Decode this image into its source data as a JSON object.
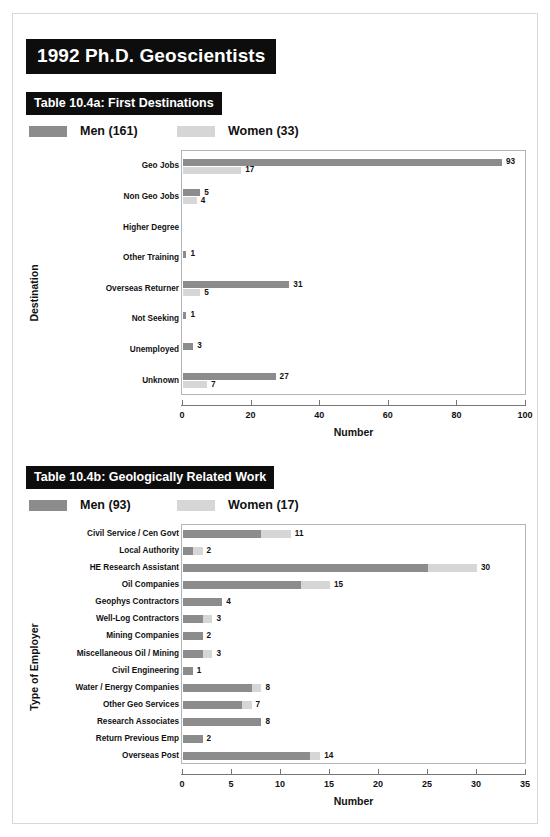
{
  "header": {
    "main_title": "1992 Ph.D. Geoscientists"
  },
  "colors": {
    "men": "#8c8c8c",
    "women": "#d6d6d6",
    "title_bg": "#0d0d0d",
    "title_fg": "#ffffff",
    "frame": "#b5b5b5"
  },
  "section_a": {
    "title": "Table 10.4a: First Destinations",
    "legend": [
      {
        "label": "Men (161)",
        "key": "men"
      },
      {
        "label": "Women (33)",
        "key": "women"
      }
    ]
  },
  "section_b": {
    "title": "Table 10.4b: Geologically Related Work",
    "legend": [
      {
        "label": "Men (93)",
        "key": "men"
      },
      {
        "label": "Women (17)",
        "key": "women"
      }
    ]
  },
  "chart_data": [
    {
      "id": "first-destinations",
      "type": "bar",
      "orientation": "horizontal",
      "grouping": "grouped",
      "title": "Table 10.4a: First Destinations",
      "xlabel": "Number",
      "ylabel": "Destination",
      "xlim": [
        0,
        100
      ],
      "xticks": [
        0,
        20,
        40,
        60,
        80,
        100
      ],
      "grid": false,
      "legend_position": "top-left",
      "categories": [
        "Geo Jobs",
        "Non Geo Jobs",
        "Higher Degree",
        "Other Training",
        "Overseas Returner",
        "Not Seeking",
        "Unemployed",
        "Unknown"
      ],
      "series": [
        {
          "name": "Men (161)",
          "key": "men",
          "values": [
            93,
            5,
            0,
            1,
            31,
            1,
            3,
            27
          ]
        },
        {
          "name": "Women (33)",
          "key": "women",
          "values": [
            17,
            4,
            0,
            0,
            5,
            0,
            0,
            7
          ]
        }
      ],
      "labels": {
        "men": [
          "93",
          "5",
          "",
          "1",
          "31",
          "1",
          "3",
          "27"
        ],
        "women": [
          "17",
          "4",
          "",
          "",
          "5",
          "",
          "",
          "7"
        ]
      }
    },
    {
      "id": "geologically-related-work",
      "type": "bar",
      "orientation": "horizontal",
      "grouping": "stacked",
      "title": "Table 10.4b: Geologically Related Work",
      "xlabel": "Number",
      "ylabel": "Type of Employer",
      "xlim": [
        0,
        35
      ],
      "xticks": [
        0,
        5,
        10,
        15,
        20,
        25,
        30,
        35
      ],
      "grid": false,
      "legend_position": "top-left",
      "categories": [
        "Civil Service / Cen Govt",
        "Local Authority",
        "HE Research Assistant",
        "Oil Companies",
        "Geophys Contractors",
        "Well-Log Contractors",
        "Mining Companies",
        "Miscellaneous Oil / Mining",
        "Civil Engineering",
        "Water / Energy Companies",
        "Other Geo Services",
        "Research Associates",
        "Return Previous Emp",
        "Overseas Post"
      ],
      "series": [
        {
          "name": "Men (93)",
          "key": "men",
          "values": [
            8,
            1,
            25,
            12,
            4,
            2,
            2,
            2,
            1,
            7,
            6,
            8,
            2,
            13
          ]
        },
        {
          "name": "Women (17)",
          "key": "women",
          "values": [
            3,
            1,
            5,
            3,
            0,
            1,
            0,
            1,
            0,
            1,
            1,
            0,
            0,
            1
          ]
        }
      ],
      "totals": [
        11,
        2,
        30,
        15,
        4,
        3,
        2,
        3,
        1,
        8,
        7,
        8,
        2,
        14
      ],
      "labels": [
        "11",
        "2",
        "30",
        "15",
        "4",
        "3",
        "2",
        "3",
        "1",
        "8",
        "7",
        "8",
        "2",
        "14"
      ]
    }
  ]
}
